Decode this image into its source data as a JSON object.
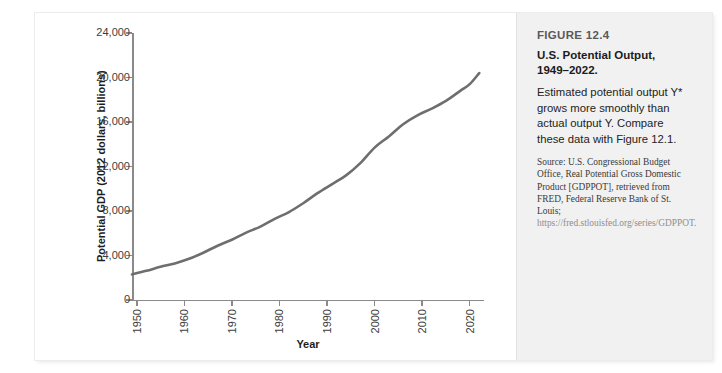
{
  "caption": {
    "figure_number": "FIGURE 12.4",
    "title_line1": "U.S. Potential Output,",
    "title_line2": "1949–2022.",
    "description": "Estimated potential output Y* grows more smoothly than actual output Y. Compare these data with Figure 12.1.",
    "source": "Source: U.S. Congressional Budget Office, Real Potential Gross Domestic Product [GDPPOT], retrieved from FRED, Federal Reserve Bank of St. Louis; ",
    "source_url": "https://fred.stlouisfed.org/series/GDPPOT."
  },
  "colors": {
    "series_line": "#6e6e6e",
    "axis": "#8a8a8a",
    "panel_background": "#f1f1f1",
    "page_background": "#ffffff",
    "tick_text": "#3d3d3d"
  },
  "chart_data": {
    "type": "line",
    "title": "",
    "xlabel": "Year",
    "ylabel": "Potential GDP (2012 dollars, billions)",
    "xlim": [
      1949,
      2023
    ],
    "ylim": [
      0,
      24000
    ],
    "grid": false,
    "legend": null,
    "ytick_labels": [
      "0",
      "4,000",
      "8,000",
      "12,000",
      "16,000",
      "20,000",
      "24,000"
    ],
    "ytick_values": [
      0,
      4000,
      8000,
      12000,
      16000,
      20000,
      24000
    ],
    "xtick_labels": [
      "1950",
      "1960",
      "1970",
      "1980",
      "1990",
      "2000",
      "2010",
      "2020"
    ],
    "xtick_values": [
      1950,
      1960,
      1970,
      1980,
      1990,
      2000,
      2010,
      2020
    ],
    "series": [
      {
        "name": "Real Potential GDP",
        "x": [
          1949,
          1952,
          1955,
          1958,
          1961,
          1964,
          1967,
          1970,
          1973,
          1976,
          1979,
          1982,
          1985,
          1988,
          1991,
          1994,
          1997,
          2000,
          2003,
          2006,
          2009,
          2012,
          2015,
          2018,
          2020,
          2022
        ],
        "values": [
          2300,
          2620,
          2980,
          3290,
          3700,
          4250,
          4880,
          5420,
          6060,
          6600,
          7300,
          7900,
          8700,
          9600,
          10400,
          11200,
          12300,
          13700,
          14700,
          15800,
          16600,
          17200,
          17900,
          18800,
          19400,
          20400
        ]
      }
    ]
  }
}
